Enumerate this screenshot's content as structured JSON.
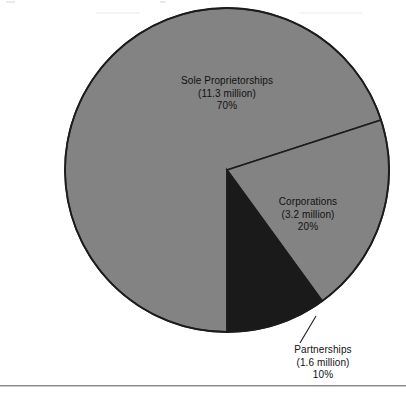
{
  "figure": {
    "background_color": "#ffffff",
    "footer_rule_color": "#8b8b8b"
  },
  "chart_data": {
    "type": "pie",
    "title": "",
    "subtitle": "",
    "xlabel": "",
    "ylabel": "",
    "legend_position": "none",
    "grid": false,
    "labels_inside": true,
    "total_units": "million businesses",
    "categories": [
      "Sole Proprietorships",
      "Corporations",
      "Partnerships"
    ],
    "values": [
      70,
      20,
      10
    ],
    "value_unit": "%",
    "counts": [
      11.3,
      3.2,
      1.6
    ],
    "count_unit": "million",
    "colors": [
      "#838383",
      "#838383",
      "#1a1a1a"
    ],
    "slices": [
      {
        "name": "Sole Proprietorships",
        "percent": 70,
        "percent_label": "70%",
        "count": 11.3,
        "count_label": "(11.3 million)",
        "color": "#838383",
        "start_angle_deg": 90,
        "end_angle_deg": 342,
        "label_placement": "inside"
      },
      {
        "name": "Corporations",
        "percent": 20,
        "percent_label": "20%",
        "count": 3.2,
        "count_label": "(3.2 million)",
        "color": "#838383",
        "start_angle_deg": 342,
        "end_angle_deg": 54,
        "label_placement": "inside"
      },
      {
        "name": "Partnerships",
        "percent": 10,
        "percent_label": "10%",
        "count": 1.6,
        "count_label": "(1.6 million)",
        "color": "#1a1a1a",
        "start_angle_deg": 54,
        "end_angle_deg": 90,
        "label_placement": "outside-leader"
      }
    ]
  },
  "labels": {
    "sole_proprietorships": {
      "name": "Sole Proprietorships",
      "count": "(11.3 million)",
      "percent": "70%"
    },
    "corporations": {
      "name": "Corporations",
      "count": "(3.2 million)",
      "percent": "20%"
    },
    "partnerships": {
      "name": "Partnerships",
      "count": "(1.6 million)",
      "percent": "10%"
    }
  }
}
